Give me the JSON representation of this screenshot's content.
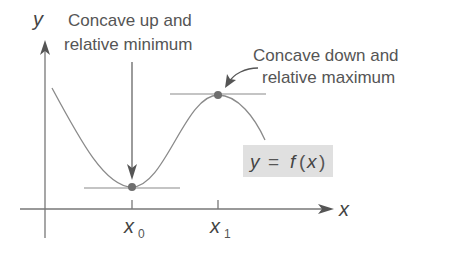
{
  "figure": {
    "axes": {
      "y_label": "y",
      "x_label": "x"
    },
    "ticks": [
      {
        "label": "x",
        "sub": "0"
      },
      {
        "label": "x",
        "sub": "1"
      }
    ],
    "annotations": {
      "min_line1": "Concave up and",
      "min_line2": "relative minimum",
      "max_line1": "Concave down and",
      "max_line2": "relative maximum"
    },
    "function_label": {
      "y": "y",
      "eq": "=",
      "f": "f",
      "open": "(",
      "x": "x",
      "close": ")"
    },
    "colors": {
      "curve": "#8a8a8a",
      "axis": "#777777",
      "point": "#6e6e6e",
      "label_box": "#e0e0e0",
      "text": "#555555"
    }
  }
}
